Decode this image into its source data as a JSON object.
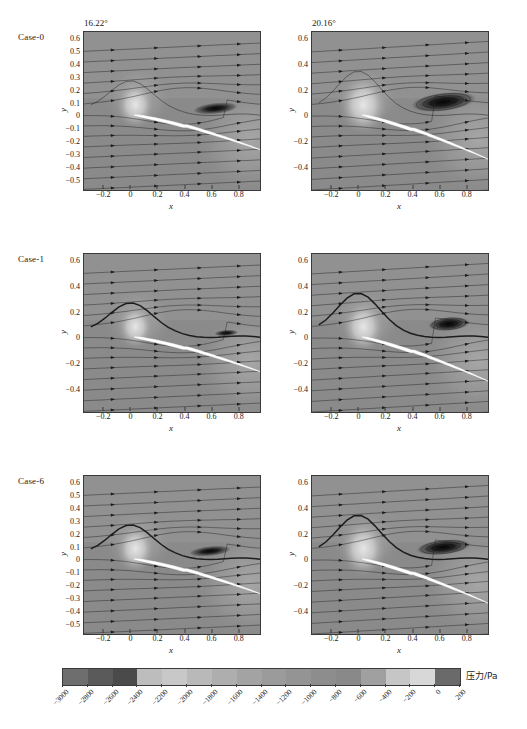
{
  "figure": {
    "type": "cfd-pressure-contour-grid",
    "rows": [
      {
        "case_label": "Case-0",
        "panels": [
          {
            "title": "16.22°",
            "xlabel": "x",
            "ylabel": "y",
            "xticks": [
              "−0.2",
              "0",
              "0.2",
              "0.4",
              "0.6",
              "0.8"
            ],
            "xtick_values": [
              -0.2,
              0,
              0.2,
              0.4,
              0.6,
              0.8
            ],
            "yticks": [
              "0.6",
              "0.5",
              "0.4",
              "0.3",
              "0.2",
              "0.1",
              "0",
              "−0.1",
              "−0.2",
              "−0.3",
              "−0.4",
              "−0.5"
            ],
            "ytick_values": [
              0.6,
              0.5,
              0.4,
              0.3,
              0.2,
              0.1,
              0,
              -0.1,
              -0.2,
              -0.3,
              -0.4,
              -0.5
            ],
            "xlim": [
              -0.35,
              0.95
            ],
            "ylim": [
              -0.56,
              0.66
            ]
          },
          {
            "title": "20.16°",
            "xlabel": "x",
            "ylabel": "y",
            "xticks": [
              "−0.2",
              "0",
              "0.2",
              "0.4",
              "0.6",
              "0.8"
            ],
            "xtick_values": [
              -0.2,
              0,
              0.2,
              0.4,
              0.6,
              0.8
            ],
            "yticks": [
              "0.6",
              "0.4",
              "0.2",
              "0",
              "−0.2",
              "−0.4"
            ],
            "ytick_values": [
              0.6,
              0.4,
              0.2,
              0,
              -0.2,
              -0.4
            ],
            "xlim": [
              -0.35,
              0.95
            ],
            "ylim": [
              -0.56,
              0.66
            ]
          }
        ]
      },
      {
        "case_label": "Case-1",
        "panels": [
          {
            "title": "",
            "xlabel": "x",
            "ylabel": "y",
            "xticks": [
              "−0.2",
              "0",
              "0.2",
              "0.4",
              "0.6",
              "0.8"
            ],
            "xtick_values": [
              -0.2,
              0,
              0.2,
              0.4,
              0.6,
              0.8
            ],
            "yticks": [
              "0.6",
              "0.4",
              "0.2",
              "0",
              "−0.2",
              "−0.4"
            ],
            "ytick_values": [
              0.6,
              0.4,
              0.2,
              0,
              -0.2,
              -0.4
            ],
            "xlim": [
              -0.35,
              0.95
            ],
            "ylim": [
              -0.56,
              0.66
            ]
          },
          {
            "title": "",
            "xlabel": "x",
            "ylabel": "y",
            "xticks": [
              "−0.2",
              "0",
              "0.2",
              "0.4",
              "0.6",
              "0.8"
            ],
            "xtick_values": [
              -0.2,
              0,
              0.2,
              0.4,
              0.6,
              0.8
            ],
            "yticks": [
              "0.6",
              "0.4",
              "0.2",
              "0",
              "−0.2",
              "−0.4"
            ],
            "ytick_values": [
              0.6,
              0.4,
              0.2,
              0,
              -0.2,
              -0.4
            ],
            "xlim": [
              -0.35,
              0.95
            ],
            "ylim": [
              -0.56,
              0.66
            ]
          }
        ]
      },
      {
        "case_label": "Case-6",
        "panels": [
          {
            "title": "",
            "xlabel": "x",
            "ylabel": "y",
            "xticks": [
              "−0.2",
              "0",
              "0.2",
              "0.4",
              "0.6",
              "0.8"
            ],
            "xtick_values": [
              -0.2,
              0,
              0.2,
              0.4,
              0.6,
              0.8
            ],
            "yticks": [
              "0.6",
              "0.5",
              "0.4",
              "0.3",
              "0.2",
              "0.1",
              "0",
              "−0.1",
              "−0.2",
              "−0.3",
              "−0.4",
              "−0.5"
            ],
            "ytick_values": [
              0.6,
              0.5,
              0.4,
              0.3,
              0.2,
              0.1,
              0,
              -0.1,
              -0.2,
              -0.3,
              -0.4,
              -0.5
            ],
            "xlim": [
              -0.35,
              0.95
            ],
            "ylim": [
              -0.56,
              0.66
            ]
          },
          {
            "title": "",
            "xlabel": "x",
            "ylabel": "y",
            "xticks": [
              "−0.2",
              "0",
              "0.2",
              "0.4",
              "0.6",
              "0.8"
            ],
            "xtick_values": [
              -0.2,
              0,
              0.2,
              0.4,
              0.6,
              0.8
            ],
            "yticks": [
              "0.6",
              "0.4",
              "0.2",
              "0",
              "−0.2",
              "−0.4"
            ],
            "ytick_values": [
              0.6,
              0.4,
              0.2,
              0,
              -0.2,
              -0.4
            ],
            "xlim": [
              -0.35,
              0.95
            ],
            "ylim": [
              -0.56,
              0.66
            ]
          }
        ]
      }
    ]
  },
  "colorbar": {
    "label": "压力/Pa",
    "min": -3000,
    "max": 200,
    "step": 200,
    "orientation": "horizontal",
    "ticks": [
      "−3000",
      "−2800",
      "−2600",
      "−2400",
      "−2200",
      "−2000",
      "−1800",
      "−1600",
      "−1400",
      "−1200",
      "−1000",
      "−800",
      "−600",
      "−400",
      "−200",
      "0",
      "200"
    ],
    "tick_values": [
      -3000,
      -2800,
      -2600,
      -2400,
      -2200,
      -2000,
      -1800,
      -1600,
      -1400,
      -1200,
      -1000,
      -800,
      -600,
      -400,
      -200,
      0,
      200
    ],
    "band_colors": [
      "#6e6e6e",
      "#5a5a5a",
      "#4a4a4a",
      "#bdbdbd",
      "#c8c8c8",
      "#b9b9b9",
      "#aeaeae",
      "#a3a3a3",
      "#9b9b9b",
      "#949494",
      "#8d8d8d",
      "#898989",
      "#a0a0a0",
      "#c6c6c6",
      "#d8d8d8",
      "#6a6a6a"
    ]
  },
  "chart_data": {
    "type": "heatmap",
    "title": "",
    "xlabel": "x",
    "ylabel": "y",
    "colorbar_label": "压力/Pa",
    "colorbar_range": [
      -3000,
      200
    ],
    "colorbar_step": 200,
    "grid": false,
    "legend_position": "bottom",
    "rows": [
      "Case-0",
      "Case-1",
      "Case-6"
    ],
    "columns": [
      "16.22°",
      "20.16°"
    ],
    "xlim": [
      -0.35,
      0.95
    ],
    "ylim": [
      -0.56,
      0.66
    ],
    "overlay": "streamlines-with-direction-arrows",
    "body": "white-airfoil-section",
    "panels": [
      {
        "row": "Case-0",
        "column": "16.22°",
        "separation_region": "compact trailing-edge suction bubble",
        "min_pressure_pa": -3000,
        "stagnation_pressure_pa": 200
      },
      {
        "row": "Case-0",
        "column": "20.16°",
        "separation_region": "large elongated suction core over suction surface",
        "min_pressure_pa": -3000,
        "stagnation_pressure_pa": 200
      },
      {
        "row": "Case-1",
        "column": "16.22°",
        "separation_region": "thin attached shear layer, small trailing bubble",
        "min_pressure_pa": -3000,
        "stagnation_pressure_pa": 200
      },
      {
        "row": "Case-1",
        "column": "20.16°",
        "separation_region": "detached vortex core downstream of mid-chord",
        "min_pressure_pa": -3000,
        "stagnation_pressure_pa": 200
      },
      {
        "row": "Case-6",
        "column": "16.22°",
        "separation_region": "moderate trailing-edge suction bubble",
        "min_pressure_pa": -3000,
        "stagnation_pressure_pa": 200
      },
      {
        "row": "Case-6",
        "column": "20.16°",
        "separation_region": "extended suction region along upper surface",
        "min_pressure_pa": -3000,
        "stagnation_pressure_pa": 200
      }
    ]
  }
}
